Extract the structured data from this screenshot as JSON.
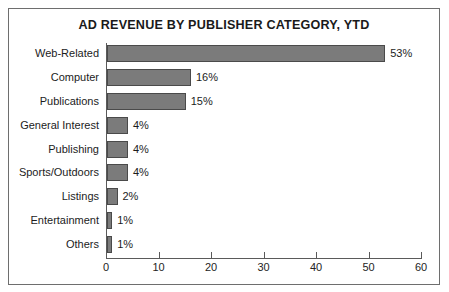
{
  "chart_data": {
    "type": "bar",
    "orientation": "horizontal",
    "title": "AD REVENUE BY PUBLISHER CATEGORY, YTD",
    "xlabel": "",
    "ylabel": "",
    "xlim": [
      0,
      60
    ],
    "xticks": [
      0,
      10,
      20,
      30,
      40,
      50,
      60
    ],
    "xtick_labels": [
      "0",
      "10",
      "20",
      "30",
      "40",
      "50",
      "60"
    ],
    "grid": false,
    "legend": false,
    "categories": [
      "Web-Related",
      "Computer",
      "Publications",
      "General Interest",
      "Publishing",
      "Sports/Outdoors",
      "Listings",
      "Entertainment",
      "Others"
    ],
    "values": [
      53,
      16,
      15,
      4,
      4,
      4,
      2,
      1,
      1
    ],
    "data_labels": [
      "53%",
      "16%",
      "15%",
      "4%",
      "4%",
      "4%",
      "2%",
      "1%",
      "1%"
    ],
    "bar_color": "#7b7b7b",
    "bar_edge_color": "#4a4a4a",
    "axis_color": "#5a5a5a",
    "text_color": "#1c1c1c",
    "background_color": "#ffffff",
    "border_color": "#6e6e6e"
  }
}
